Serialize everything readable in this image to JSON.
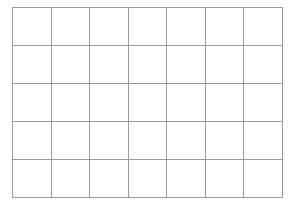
{
  "grid": {
    "columns": 7,
    "rows": 5,
    "line_color": "#9a9a9a",
    "background": "#ffffff"
  }
}
